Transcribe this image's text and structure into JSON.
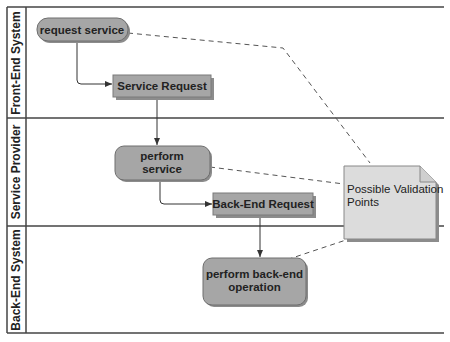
{
  "diagram": {
    "type": "swimlane-activity",
    "lanes": [
      {
        "id": "front-end",
        "label": "Front-End System"
      },
      {
        "id": "service-provider",
        "label": "Service Provider"
      },
      {
        "id": "back-end",
        "label": "Back-End System"
      }
    ],
    "nodes": {
      "request_service": {
        "label": "request service",
        "kind": "activity",
        "lane": "front-end"
      },
      "service_request": {
        "label": "Service Request",
        "kind": "object",
        "lane": "front-end"
      },
      "perform_service": {
        "line1": "perform",
        "line2": "service",
        "kind": "activity",
        "lane": "service-provider"
      },
      "backend_request": {
        "label": "Back-End Request",
        "kind": "object",
        "lane": "service-provider"
      },
      "perform_backend": {
        "line1": "perform back-end",
        "line2": "operation",
        "kind": "activity",
        "lane": "back-end"
      }
    },
    "note": {
      "line1": "Possible Validation",
      "line2": "Points"
    },
    "edges": [
      {
        "from": "request_service",
        "to": "service_request",
        "style": "solid-arrow"
      },
      {
        "from": "service_request",
        "to": "perform_service",
        "style": "solid-arrow"
      },
      {
        "from": "perform_service",
        "to": "backend_request",
        "style": "solid-arrow"
      },
      {
        "from": "backend_request",
        "to": "perform_backend",
        "style": "solid-arrow"
      },
      {
        "from": "note",
        "to": "request_service",
        "style": "dashed"
      },
      {
        "from": "note",
        "to": "perform_service",
        "style": "dashed"
      },
      {
        "from": "note",
        "to": "perform_backend",
        "style": "dashed"
      }
    ],
    "colors": {
      "node_fill": "#a6a6a6",
      "node_stroke": "#6e6e6e",
      "shadow": "#8c8c8c",
      "note_fill": "#dcdcdc",
      "line": "#333333",
      "dash": "#555555"
    }
  }
}
